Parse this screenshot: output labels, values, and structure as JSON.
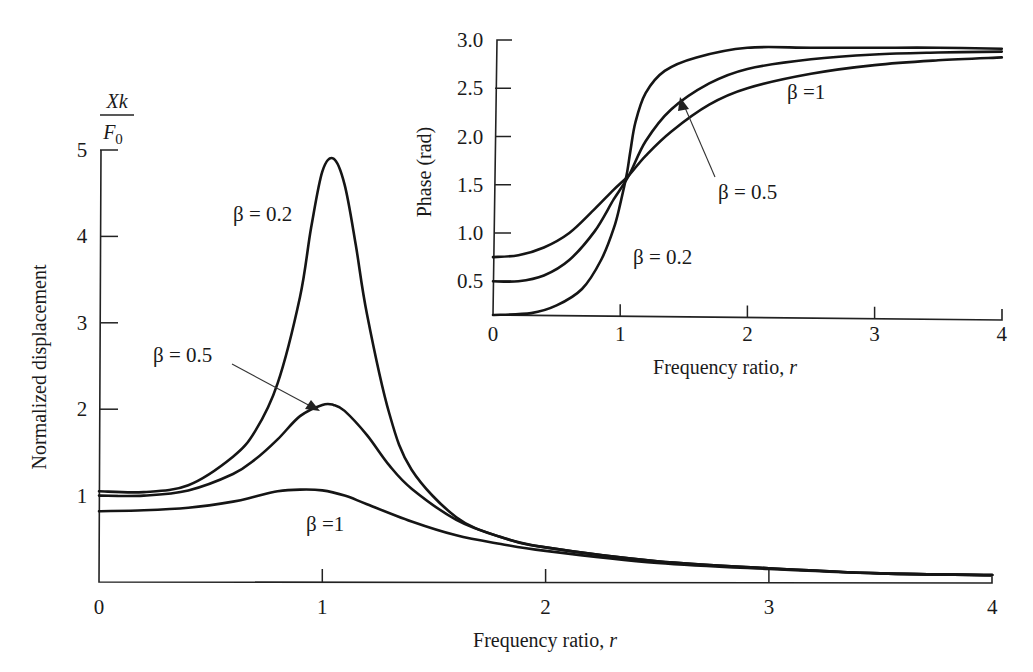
{
  "chart_data": [
    {
      "type": "line",
      "title": "",
      "xlabel": "Frequency ratio, r",
      "ylabel": "Normalized displacement",
      "ylabel_fraction": {
        "numerator": "Xk",
        "denominator": "F0"
      },
      "xlim": [
        0,
        4
      ],
      "ylim": [
        0,
        5
      ],
      "x_ticks": [
        "0",
        "1",
        "2",
        "3",
        "4"
      ],
      "y_ticks": [
        "1",
        "2",
        "3",
        "4",
        "5"
      ],
      "grid": false,
      "legend": "inline annotations",
      "series": [
        {
          "name": "β = 0.2",
          "x": [
            0,
            0.2,
            0.4,
            0.6,
            0.7,
            0.8,
            0.9,
            0.95,
            1.0,
            1.05,
            1.1,
            1.15,
            1.2,
            1.3,
            1.4,
            1.6,
            1.8,
            2.0,
            2.5,
            3.0,
            3.5,
            4.0
          ],
          "y": [
            1.05,
            1.04,
            1.12,
            1.45,
            1.75,
            2.3,
            3.3,
            4.1,
            4.75,
            4.9,
            4.6,
            3.9,
            3.1,
            1.95,
            1.3,
            0.75,
            0.52,
            0.4,
            0.24,
            0.16,
            0.1,
            0.08
          ]
        },
        {
          "name": "β = 0.5",
          "x": [
            0,
            0.2,
            0.4,
            0.6,
            0.7,
            0.8,
            0.9,
            1.0,
            1.05,
            1.1,
            1.2,
            1.3,
            1.4,
            1.6,
            1.8,
            2.0,
            2.5,
            3.0,
            3.5,
            4.0
          ],
          "y": [
            1.0,
            1.0,
            1.06,
            1.25,
            1.42,
            1.65,
            1.92,
            2.05,
            2.05,
            1.98,
            1.7,
            1.35,
            1.08,
            0.72,
            0.52,
            0.4,
            0.24,
            0.16,
            0.1,
            0.08
          ]
        },
        {
          "name": "β = 1",
          "x": [
            0,
            0.2,
            0.4,
            0.6,
            0.7,
            0.8,
            0.9,
            1.0,
            1.1,
            1.2,
            1.4,
            1.6,
            1.8,
            2.0,
            2.5,
            3.0,
            3.5,
            4.0
          ],
          "y": [
            0.82,
            0.83,
            0.86,
            0.93,
            0.99,
            1.05,
            1.07,
            1.06,
            1.0,
            0.9,
            0.7,
            0.54,
            0.44,
            0.36,
            0.22,
            0.15,
            0.1,
            0.08
          ]
        }
      ],
      "annotations": [
        {
          "text": "β = 0.2",
          "series": "β = 0.2"
        },
        {
          "text": "β = 0.5",
          "series": "β = 0.5",
          "arrow": true
        },
        {
          "text": "β =1",
          "series": "β = 1"
        }
      ]
    },
    {
      "type": "line",
      "title": "",
      "xlabel": "Frequency ratio, r",
      "ylabel": "Phase (rad)",
      "xlim": [
        0,
        4
      ],
      "ylim": [
        0.15,
        3.0
      ],
      "x_ticks": [
        "0",
        "1",
        "2",
        "3",
        "4"
      ],
      "y_ticks": [
        "0.5",
        "1.0",
        "1.5",
        "2.0",
        "2.5",
        "3.0"
      ],
      "grid": false,
      "legend": "inline annotations",
      "series": [
        {
          "name": "β = 0.2",
          "x": [
            0,
            0.3,
            0.5,
            0.7,
            0.85,
            0.95,
            1.0,
            1.05,
            1.08,
            1.12,
            1.2,
            1.35,
            1.6,
            2.0,
            2.5,
            3.0,
            3.5,
            4.0
          ],
          "y": [
            0.15,
            0.17,
            0.25,
            0.42,
            0.72,
            1.05,
            1.3,
            1.6,
            1.85,
            2.15,
            2.45,
            2.68,
            2.82,
            2.92,
            2.92,
            2.92,
            2.92,
            2.91
          ]
        },
        {
          "name": "β = 0.5",
          "x": [
            0,
            0.2,
            0.4,
            0.6,
            0.8,
            0.95,
            1.07,
            1.2,
            1.4,
            1.7,
            2.0,
            2.5,
            3.0,
            3.5,
            4.0
          ],
          "y": [
            0.5,
            0.5,
            0.56,
            0.72,
            1.02,
            1.35,
            1.6,
            1.95,
            2.28,
            2.55,
            2.7,
            2.8,
            2.85,
            2.87,
            2.88
          ]
        },
        {
          "name": "β = 1",
          "x": [
            0,
            0.2,
            0.4,
            0.6,
            0.8,
            0.95,
            1.07,
            1.2,
            1.4,
            1.7,
            2.0,
            2.5,
            3.0,
            3.5,
            4.0
          ],
          "y": [
            0.75,
            0.77,
            0.85,
            1.0,
            1.25,
            1.45,
            1.6,
            1.8,
            2.05,
            2.33,
            2.5,
            2.65,
            2.74,
            2.79,
            2.82
          ]
        }
      ],
      "annotations": [
        {
          "text": "β =1",
          "series": "β = 1"
        },
        {
          "text": "β = 0.5",
          "series": "β = 0.5",
          "arrow": true
        },
        {
          "text": "β = 0.2",
          "series": "β = 0.2"
        }
      ]
    }
  ],
  "main": {
    "ylabel": "Normalized displacement",
    "yfrac_num": "Xk",
    "yfrac_den": "F",
    "yfrac_den_sub": "0",
    "xlabel": "Frequency ratio, r",
    "xlabel_prefix": "Frequency ratio, ",
    "xlabel_var": "r",
    "x_ticks": [
      "0",
      "1",
      "2",
      "3",
      "4"
    ],
    "y_ticks": [
      "1",
      "2",
      "3",
      "4",
      "5"
    ],
    "labels": {
      "b02": "β = 0.2",
      "b05": "β = 0.5",
      "b1": "β =1"
    }
  },
  "inset": {
    "ylabel": "Phase (rad)",
    "xlabel_prefix": "Frequency ratio, ",
    "xlabel_var": "r",
    "x_ticks": [
      "0",
      "1",
      "2",
      "3",
      "4"
    ],
    "y_ticks": [
      "0.5",
      "1.0",
      "1.5",
      "2.0",
      "2.5",
      "3.0"
    ],
    "labels": {
      "b1": "β =1",
      "b05": "β = 0.5",
      "b02": "β = 0.2"
    }
  }
}
